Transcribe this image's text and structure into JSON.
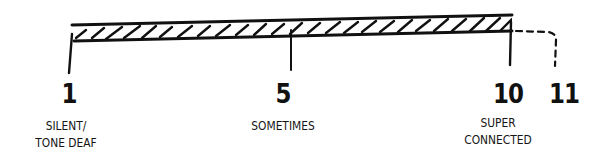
{
  "diagram": {
    "type": "scale",
    "style": "hand-drawn",
    "colors": {
      "ink": "#111111",
      "background": "#ffffff"
    },
    "filled_range": {
      "from": 1,
      "to": 10,
      "pattern": "diagonal-hatch"
    },
    "extension": {
      "from": 10,
      "to": 11,
      "style": "dashed"
    },
    "ticks": [
      {
        "value": "1",
        "label_line1": "SILENT/",
        "label_line2": "TONE DEAF"
      },
      {
        "value": "5",
        "label_line1": "SOMETIMES",
        "label_line2": ""
      },
      {
        "value": "10",
        "label_line1": "SUPER",
        "label_line2": "CONNECTED"
      },
      {
        "value": "11",
        "label_line1": "",
        "label_line2": ""
      }
    ]
  }
}
